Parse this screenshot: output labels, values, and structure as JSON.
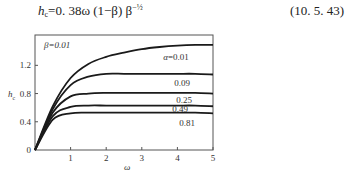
{
  "equation": {
    "lhs_symbol": "h",
    "lhs_sub": "c",
    "rhs": "=0. 38ω (1−β) β",
    "exponent": "−½",
    "number": "(10. 5. 43)"
  },
  "chart_data": {
    "type": "line",
    "title": "",
    "xlabel": "ω",
    "ylabel": "h_c",
    "xlim": [
      0,
      5
    ],
    "ylim": [
      0,
      1.63
    ],
    "xticks": [
      1,
      2,
      3,
      4,
      5
    ],
    "yticks": [
      0,
      0.4,
      0.8,
      1.2
    ],
    "xtick_labels": [
      "1",
      "2",
      "3",
      "4",
      "5"
    ],
    "ytick_labels": [
      "0",
      "0.4",
      "0.8",
      "1.2"
    ],
    "grid": false,
    "annotation": "β=0.01",
    "x": [
      0,
      0.5,
      1,
      1.5,
      2,
      2.5,
      3,
      3.5,
      4,
      4.5,
      5
    ],
    "series": [
      {
        "name": "α=0.01",
        "label": "α=0.01",
        "values": [
          0,
          0.62,
          1.02,
          1.22,
          1.32,
          1.38,
          1.43,
          1.46,
          1.48,
          1.49,
          1.49
        ]
      },
      {
        "name": "α=0.09",
        "label": "0.09",
        "values": [
          0,
          0.58,
          0.92,
          1.04,
          1.08,
          1.08,
          1.08,
          1.08,
          1.08,
          1.08,
          1.07
        ]
      },
      {
        "name": "α=0.25",
        "label": "0.25",
        "values": [
          0,
          0.53,
          0.76,
          0.8,
          0.81,
          0.81,
          0.81,
          0.81,
          0.81,
          0.81,
          0.8
        ]
      },
      {
        "name": "α=0.49",
        "label": "0.49",
        "values": [
          0,
          0.48,
          0.61,
          0.63,
          0.63,
          0.63,
          0.63,
          0.63,
          0.63,
          0.63,
          0.62
        ]
      },
      {
        "name": "α=0.81",
        "label": "0.81",
        "values": [
          0,
          0.43,
          0.52,
          0.53,
          0.53,
          0.53,
          0.53,
          0.53,
          0.53,
          0.53,
          0.52
        ]
      }
    ]
  }
}
